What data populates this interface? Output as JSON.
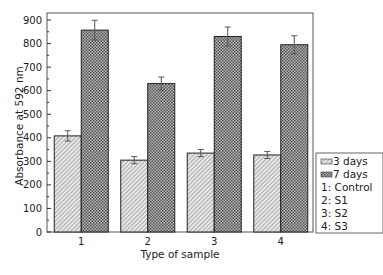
{
  "chart_data": {
    "type": "bar",
    "title": "",
    "xlabel": "Type of sample",
    "ylabel": "Absorbance at 592 nm",
    "categories": [
      "1",
      "2",
      "3",
      "4"
    ],
    "series": [
      {
        "name": "3 days",
        "values": [
          408,
          305,
          335,
          327
        ],
        "errors": [
          22,
          15,
          15,
          15
        ],
        "pattern": "diagonal-hatch"
      },
      {
        "name": "7 days",
        "values": [
          857,
          630,
          830,
          795
        ],
        "errors": [
          42,
          28,
          40,
          38
        ],
        "pattern": "crosshatch"
      }
    ],
    "ylim": [
      0,
      900
    ],
    "yticks": [
      0,
      100,
      200,
      300,
      400,
      500,
      600,
      700,
      800,
      900
    ],
    "grid": false,
    "legend": {
      "position": "right",
      "entries": [
        "3 days",
        "7 days"
      ],
      "notes": [
        "1: Control",
        "2: S1",
        "3: S2",
        "4: S3"
      ]
    }
  }
}
